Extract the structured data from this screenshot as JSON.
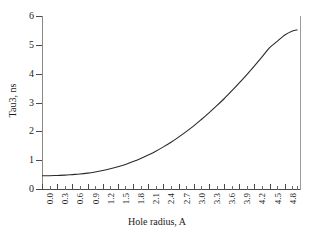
{
  "chart_data": {
    "type": "line",
    "title": "",
    "xlabel": "Hole radius, A",
    "ylabel": "Tau3, ns",
    "xlim": [
      0.0,
      5.1
    ],
    "ylim": [
      0,
      6
    ],
    "grid": false,
    "legend": null,
    "xticklabels": [
      "0.0",
      "0.3",
      "0.6",
      "0.9",
      "1.2",
      "1.5",
      "1.8",
      "2.1",
      "2.4",
      "2.7",
      "3.0",
      "3.3",
      "3.6",
      "3.9",
      "4.2",
      "4.5",
      "4.8"
    ],
    "xtickvalues": [
      0.0,
      0.3,
      0.6,
      0.9,
      1.2,
      1.5,
      1.8,
      2.1,
      2.4,
      2.7,
      3.0,
      3.3,
      3.6,
      3.9,
      4.2,
      4.5,
      4.8
    ],
    "yticklabels": [
      "0",
      "1",
      "2",
      "3",
      "4",
      "5",
      "6"
    ],
    "ytickvalues": [
      0,
      1,
      2,
      3,
      4,
      5,
      6
    ],
    "series": [
      {
        "name": "Tau3",
        "x": [
          0.0,
          0.15,
          0.3,
          0.45,
          0.6,
          0.75,
          0.9,
          1.05,
          1.2,
          1.35,
          1.5,
          1.65,
          1.8,
          1.95,
          2.1,
          2.25,
          2.4,
          2.55,
          2.7,
          2.85,
          3.0,
          3.15,
          3.3,
          3.45,
          3.6,
          3.75,
          3.9,
          4.05,
          4.2,
          4.35,
          4.5,
          4.65,
          4.8,
          4.95,
          5.05
        ],
        "values": [
          0.46,
          0.46,
          0.47,
          0.48,
          0.5,
          0.52,
          0.55,
          0.59,
          0.64,
          0.7,
          0.77,
          0.85,
          0.95,
          1.06,
          1.18,
          1.31,
          1.46,
          1.62,
          1.8,
          1.99,
          2.19,
          2.41,
          2.64,
          2.88,
          3.13,
          3.4,
          3.68,
          3.97,
          4.27,
          4.58,
          4.9,
          5.12,
          5.34,
          5.48,
          5.52
        ]
      }
    ]
  },
  "axes": {
    "x_title": "Hole radius, A",
    "y_title": "Tau3, ns"
  },
  "colors": {
    "curve": "#2a2a2a",
    "axis": "#4a4a4a",
    "right_rule": "#9a9a9a",
    "text": "#1b1b1b",
    "background": "#ffffff"
  }
}
